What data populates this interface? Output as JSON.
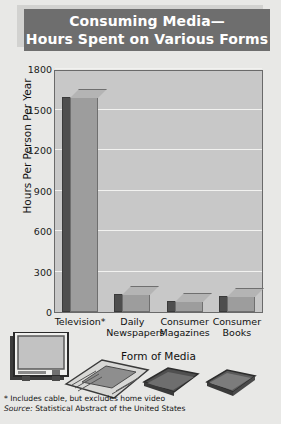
{
  "title": {
    "line1": "Consuming Media—",
    "line2": "Hours Spent on Various Forms"
  },
  "footnotes": {
    "note": "* Includes cable, but excludes home video",
    "source_prefix": "Source:",
    "source_text": " Statistical Abstract of the United States"
  },
  "colors": {
    "banner": "#6e6e6e",
    "banner_shadow": "#d2d2d0",
    "plot_background": "#c8c8c8",
    "page_background": "#e8e8e6",
    "bar_front": "#9d9d9d",
    "bar_side": "#4e4e4e",
    "bar_top": "#b4b4b4",
    "gridline": "#f2f2f0",
    "frame_border": "#6a6a6a",
    "text": "#101010"
  },
  "art": {
    "television": "television-illustration",
    "newspaper": "newspaper-illustration",
    "magazine": "magazine-illustration",
    "book": "book-illustration"
  },
  "chart_data": {
    "type": "bar",
    "title": "Consuming Media— Hours Spent on Various Forms",
    "xlabel": "Form of Media",
    "ylabel": "Hours Per Person Per Year",
    "categories": [
      "Television*",
      "Daily Newspapers",
      "Consumer Magazines",
      "Consumer Books"
    ],
    "category_lines": [
      [
        "Television*"
      ],
      [
        "Daily",
        "Newspapers"
      ],
      [
        "Consumer",
        "Magazines"
      ],
      [
        "Consumer",
        "Books"
      ]
    ],
    "values": [
      1590,
      135,
      80,
      120
    ],
    "ylim": [
      0,
      1800
    ],
    "yticks": [
      0,
      300,
      600,
      900,
      1200,
      1500,
      1800
    ],
    "ytick_labels": [
      "0",
      "300",
      "600",
      "900",
      "1200",
      "1500",
      "1800"
    ],
    "grid": true,
    "legend": "none",
    "style": "3d-bars"
  }
}
